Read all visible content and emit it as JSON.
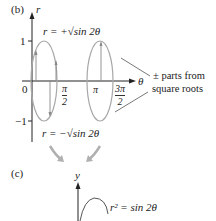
{
  "panel_b": {
    "label": "(b)",
    "y_axis": "r",
    "x_axis": "θ",
    "tick_1": "1",
    "tick_neg1": "−1",
    "tick_0": "0",
    "tick_pi_half_num": "π",
    "tick_pi_half_den": "2",
    "tick_pi": "π",
    "tick_3pi_half_num": "3π",
    "tick_3pi_half_den": "2",
    "upper_eq": "r = +√sin 2θ",
    "lower_eq": "r = −√sin 2θ",
    "annotation_line1": "± parts from",
    "annotation_line2": "square roots"
  },
  "panel_c": {
    "label": "(c)",
    "y_axis": "y",
    "eq": "r² = sin 2θ"
  },
  "colors": {
    "curve": "#a8a8a8",
    "axis": "#222222",
    "arrow": "#b0b0b0"
  }
}
